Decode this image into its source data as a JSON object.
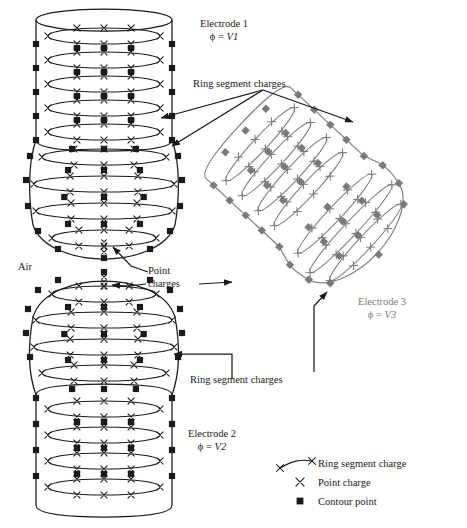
{
  "figure": {
    "background": "#ffffff",
    "ink_color": "#1a1a1a",
    "electrode3_color": "#7a7a7a"
  },
  "labels": {
    "electrode1_name": "Electrode 1",
    "electrode1_phi": "ϕ = ",
    "electrode1_value": "V1",
    "electrode2_name": "Electrode 2",
    "electrode2_phi": "ϕ = ",
    "electrode2_value": "V2",
    "electrode3_name": "Electrode 3",
    "electrode3_phi": "ϕ = ",
    "electrode3_value": "V3",
    "air": "Air",
    "ring_segment_charges_top": "Ring segment charges",
    "ring_segment_charges_bottom": "Ring segment charges",
    "point_charges_line1": "Point",
    "point_charges_line2": "charges"
  },
  "legend": {
    "items": [
      {
        "symbol": "ring-segment-charge-symbol",
        "label": "Ring segment charge"
      },
      {
        "symbol": "point-charge-symbol",
        "label": "Point charge"
      },
      {
        "symbol": "contour-point-symbol",
        "label": "Contour point"
      }
    ]
  },
  "geometry": {
    "electrode1": {
      "shape": "cylinder-with-hemispherical-bottom",
      "cylinder": {
        "cx": 104,
        "top_y": 20,
        "bottom_y": 140,
        "rx": 68,
        "ry": 11
      },
      "sphere": {
        "cx": 104,
        "cy": 197,
        "rx": 75,
        "ry": 62
      },
      "ring_count": 9,
      "ring_rows_y": [
        36,
        60,
        84,
        108,
        132,
        156,
        182,
        208,
        234
      ],
      "contour_rows_y": [
        48,
        72,
        96,
        120,
        144,
        169,
        195,
        221,
        246
      ],
      "marks_per_ring": 3,
      "contours_per_row": 3
    },
    "electrode2": {
      "shape": "hemispherical-top-with-cylinder",
      "sphere": {
        "cx": 104,
        "cy": 333,
        "rx": 75,
        "ry": 62
      },
      "cylinder": {
        "cx": 104,
        "top_y": 395,
        "bottom_y": 505,
        "rx": 68,
        "ry": 11
      },
      "ring_count": 8,
      "ring_rows_y": [
        293,
        318,
        343,
        368,
        406,
        432,
        458,
        484
      ],
      "contour_rows_y": [
        282,
        306,
        331,
        356,
        394,
        419,
        445,
        471
      ],
      "marks_per_ring": 3,
      "contours_per_row": 3
    },
    "electrode3": {
      "shape": "rotated-cylinder-with-hemispherical-end",
      "rotation_deg": -47,
      "center": {
        "x": 318,
        "y": 198
      },
      "ring_count": 9,
      "marks_per_ring": 3,
      "contours_per_row": 3
    }
  },
  "annotations": {
    "ring_top": {
      "text_anchor": {
        "x": 263,
        "y": 90
      },
      "arrow_targets": [
        {
          "x": 161,
          "y": 118
        },
        {
          "x": 172,
          "y": 146
        },
        {
          "x": 353,
          "y": 122
        }
      ]
    },
    "point_charges": {
      "text_anchor": {
        "x": 175,
        "y": 278
      },
      "arrow_targets": [
        {
          "x": 113,
          "y": 245
        },
        {
          "x": 110,
          "y": 285
        },
        {
          "x": 232,
          "y": 282
        }
      ]
    },
    "ring_bottom": {
      "text_anchor": {
        "x": 240,
        "y": 381
      },
      "arrow_targets": [
        {
          "x": 173,
          "y": 358
        },
        {
          "x": 327,
          "y": 293
        }
      ]
    }
  }
}
